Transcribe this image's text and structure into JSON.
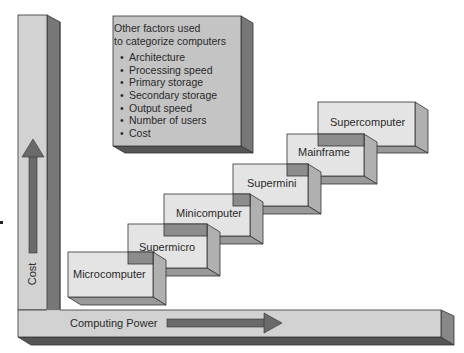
{
  "factors_box": {
    "heading_line1": "Other factors used",
    "heading_line2": "to categorize computers",
    "items": [
      "Architecture",
      "Processing speed",
      "Primary storage",
      "Secondary storage",
      "Output speed",
      "Number of users",
      "Cost"
    ]
  },
  "axes": {
    "y_label": "Cost",
    "x_label": "Computing Power"
  },
  "steps": [
    {
      "label": "Microcomputer"
    },
    {
      "label": "Supermicro"
    },
    {
      "label": "Minicomputer"
    },
    {
      "label": "Supermini"
    },
    {
      "label": "Mainframe"
    },
    {
      "label": "Supercomputer"
    }
  ],
  "colors": {
    "front_face": "#e4e4e4",
    "side_face": "#a6a6a6",
    "dark_face": "#6e6e6e",
    "overlap": "#8c8c8c",
    "bar_front": "#d2d2d2",
    "arrow": "#6a6a6a"
  }
}
